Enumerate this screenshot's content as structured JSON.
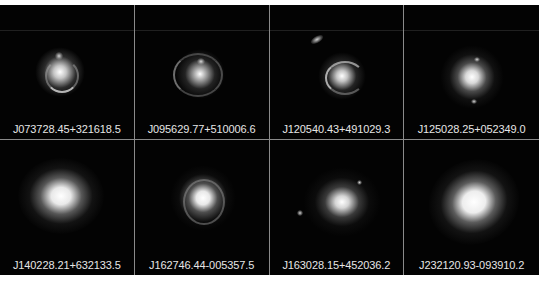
{
  "figure": {
    "layout": {
      "rows": 2,
      "columns": 4
    },
    "background_color": "#030303",
    "grid_line_color": "#8a8a8a",
    "label_color": "#e6e6e6",
    "panels": [
      {
        "label": "J073728.45+321618.5",
        "morphology": "lens-ring-with-arcs"
      },
      {
        "label": "J095629.77+510006.6",
        "morphology": "lens-ring-large"
      },
      {
        "label": "J120540.43+491029.3",
        "morphology": "lens-arc-with-companion"
      },
      {
        "label": "J125028.25+052349.0",
        "morphology": "bright-core-with-knots"
      },
      {
        "label": "J140228.21+632133.5",
        "morphology": "bright-elliptical"
      },
      {
        "label": "J162746.44-005357.5",
        "morphology": "bright-core-with-ring"
      },
      {
        "label": "J163028.15+452036.2",
        "morphology": "core-with-faint-arcs"
      },
      {
        "label": "J232120.93-093910.2",
        "morphology": "bright-elliptical"
      }
    ]
  }
}
